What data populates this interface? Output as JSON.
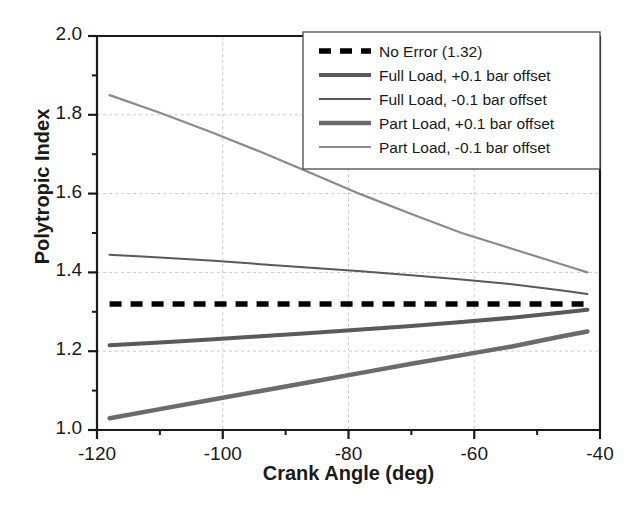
{
  "chart_data": {
    "type": "line",
    "title": "",
    "xlabel": "Crank Angle (deg)",
    "ylabel": "Polytropic Index",
    "xlim": [
      -120,
      -40
    ],
    "ylim": [
      1.0,
      2.0
    ],
    "xticks": [
      -120,
      -100,
      -80,
      -60,
      -40
    ],
    "xtick_labels": [
      "-120",
      "-100",
      "-80",
      "-60",
      "-40"
    ],
    "yticks": [
      1.0,
      1.2,
      1.4,
      1.6,
      1.8,
      2.0
    ],
    "ytick_labels": [
      "1.0",
      "1.2",
      "1.4",
      "1.6",
      "1.8",
      "2.0"
    ],
    "xminor_step": 10,
    "yminor_step": 0.1,
    "grid": "major-dashed-light",
    "legend_position": "top-right",
    "x": [
      -118,
      -110,
      -102,
      -94,
      -86,
      -78,
      -70,
      -62,
      -54,
      -46,
      -42
    ],
    "series": [
      {
        "name": "No Error (1.32)",
        "color": "#000000",
        "width": 5.5,
        "dash": "12,9",
        "values": [
          1.32,
          1.32,
          1.32,
          1.32,
          1.32,
          1.32,
          1.32,
          1.32,
          1.32,
          1.32,
          1.32
        ]
      },
      {
        "name": "Full Load, +0.1 bar offset",
        "color": "#5a5a5a",
        "width": 4.0,
        "dash": "none",
        "values": [
          1.215,
          1.222,
          1.23,
          1.238,
          1.246,
          1.255,
          1.264,
          1.274,
          1.285,
          1.298,
          1.305
        ]
      },
      {
        "name": "Full Load, -0.1 bar offset",
        "color": "#595959",
        "width": 2.0,
        "dash": "none",
        "values": [
          1.445,
          1.438,
          1.43,
          1.421,
          1.412,
          1.403,
          1.393,
          1.382,
          1.37,
          1.354,
          1.345
        ]
      },
      {
        "name": "Part Load, +0.1 bar offset",
        "color": "#6b6b6b",
        "width": 4.5,
        "dash": "none",
        "values": [
          1.03,
          1.053,
          1.076,
          1.099,
          1.122,
          1.145,
          1.168,
          1.19,
          1.212,
          1.238,
          1.25
        ]
      },
      {
        "name": "Part Load, -0.1 bar offset",
        "color": "#8a8a8a",
        "width": 2.2,
        "dash": "none",
        "values": [
          1.85,
          1.805,
          1.757,
          1.706,
          1.652,
          1.598,
          1.548,
          1.5,
          1.46,
          1.42,
          1.4
        ]
      }
    ]
  },
  "legend": {
    "items": [
      {
        "label": "No Error (1.32)"
      },
      {
        "label": "Full Load, +0.1 bar offset"
      },
      {
        "label": "Full Load, -0.1 bar offset"
      },
      {
        "label": "Part Load, +0.1 bar offset"
      },
      {
        "label": "Part Load, -0.1 bar offset"
      }
    ]
  }
}
